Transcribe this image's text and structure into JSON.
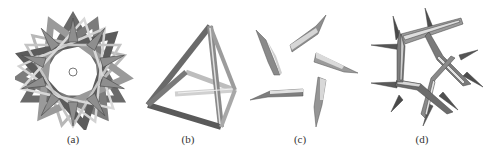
{
  "figure": {
    "panels": [
      {
        "id": "a",
        "label": "(a)",
        "depicts": "compound of five tetrahedral frames (star)"
      },
      {
        "id": "b",
        "label": "(b)",
        "depicts": "single tetrahedral frame"
      },
      {
        "id": "c",
        "label": "(c)",
        "depicts": "five separated bar pieces"
      },
      {
        "id": "d",
        "label": "(d)",
        "depicts": "pentagonal ring of interlocking bars"
      }
    ]
  },
  "colors": {
    "dark": "#555555",
    "mid": "#8a8a8a",
    "light": "#c8c8c8",
    "highlight": "#e6e6e6",
    "background": "#ffffff"
  }
}
